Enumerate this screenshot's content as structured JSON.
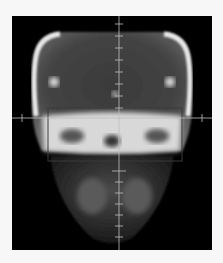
{
  "image": {
    "subject": "frontal skull radiograph",
    "background": "#000000",
    "page_background": "#f7f7f7",
    "crosshair_color": "#bfbfbf",
    "roi_box_color": "#3a3a3a"
  }
}
